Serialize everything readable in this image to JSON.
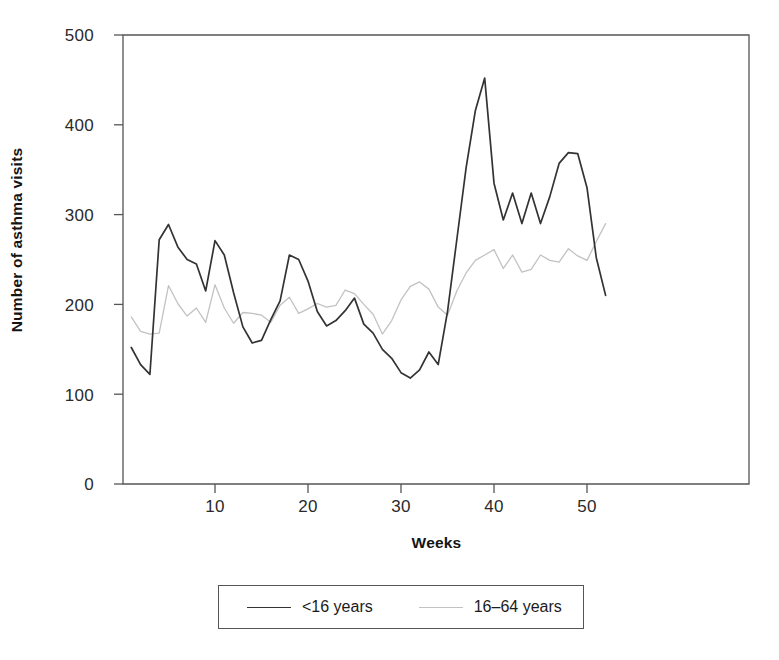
{
  "chart_data": {
    "type": "line",
    "title": "",
    "xlabel": "Weeks",
    "ylabel": "Number of asthma visits",
    "xlim": [
      1,
      52
    ],
    "ylim": [
      0,
      500
    ],
    "grid": false,
    "legend_position": "below-axes",
    "xticks": [
      10,
      20,
      30,
      40,
      50
    ],
    "yticks": [
      0,
      100,
      200,
      300,
      400,
      500
    ],
    "x": [
      1,
      2,
      3,
      4,
      5,
      6,
      7,
      8,
      9,
      10,
      11,
      12,
      13,
      14,
      15,
      16,
      17,
      18,
      19,
      20,
      21,
      22,
      23,
      24,
      25,
      26,
      27,
      28,
      29,
      30,
      31,
      32,
      33,
      34,
      35,
      36,
      37,
      38,
      39,
      40,
      41,
      42,
      43,
      44,
      45,
      46,
      47,
      48,
      49,
      50,
      51,
      52
    ],
    "series": [
      {
        "name": "<16 years",
        "color": "#333333",
        "width": 1.7,
        "values": [
          152,
          133,
          122,
          272,
          289,
          264,
          250,
          245,
          215,
          271,
          255,
          213,
          175,
          157,
          160,
          183,
          204,
          255,
          250,
          226,
          192,
          176,
          182,
          193,
          207,
          178,
          168,
          150,
          140,
          124,
          118,
          127,
          147,
          133,
          192,
          272,
          352,
          416,
          452,
          335,
          294,
          324,
          290,
          324,
          290,
          320,
          357,
          369,
          368,
          330,
          252,
          210
        ]
      },
      {
        "name": "16–64 years",
        "color": "#c2c2c2",
        "width": 1.3,
        "values": [
          186,
          170,
          167,
          168,
          221,
          201,
          187,
          196,
          180,
          222,
          196,
          179,
          191,
          190,
          188,
          180,
          199,
          208,
          190,
          195,
          201,
          197,
          199,
          216,
          212,
          200,
          189,
          167,
          182,
          205,
          220,
          225,
          217,
          197,
          188,
          215,
          235,
          249,
          255,
          261,
          240,
          255,
          236,
          239,
          255,
          249,
          247,
          262,
          254,
          249,
          270,
          290
        ]
      }
    ]
  },
  "legend": {
    "entries": [
      {
        "label": "<16 years"
      },
      {
        "label": "16–64 years"
      }
    ]
  },
  "axes": {
    "frame_color": "#555555"
  }
}
